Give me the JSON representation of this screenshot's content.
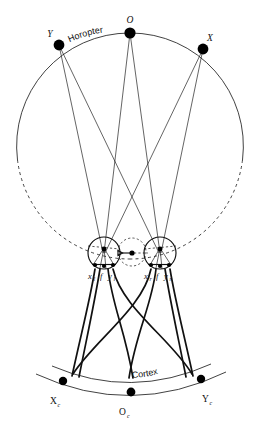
{
  "figure": {
    "background_color": "#ffffff",
    "line_color": "#111111"
  },
  "labels": {
    "horopter_curve": "Horopter",
    "cortex_curve": "Cortex",
    "point_left": "Y",
    "point_top": "O",
    "point_right": "X",
    "eye_left_temporal": "x",
    "eye_left_temporal_sub": "l",
    "eye_left_fovea": "f",
    "eye_left_nasal": "y",
    "eye_left_nasal_sub": "l",
    "eye_right_temporal": "x",
    "eye_right_temporal_sub": "r",
    "eye_right_fovea": "f",
    "eye_right_nasal": "y",
    "eye_right_nasal_sub": "r",
    "cortex_left": "X",
    "cortex_left_sub": "c",
    "cortex_center": "O",
    "cortex_center_sub": "c",
    "cortex_right": "Y",
    "cortex_right_sub": "c"
  },
  "geometry": {
    "horopter_circle": {
      "cx": 130,
      "cy": 146,
      "r": 113
    },
    "stimulus_points": [
      {
        "name": "Y",
        "x": 59,
        "y": 45,
        "r": 5.4
      },
      {
        "name": "O",
        "x": 130,
        "y": 33,
        "r": 5.6
      },
      {
        "name": "X",
        "x": 203,
        "y": 49,
        "r": 5.4
      }
    ],
    "eyes": [
      {
        "name": "left-eye",
        "cx": 104,
        "cy": 253,
        "r": 16
      },
      {
        "name": "right-eye",
        "cx": 160,
        "cy": 253,
        "r": 16
      }
    ],
    "cyclopean_eye": {
      "cx": 132,
      "cy": 252,
      "r": 14
    },
    "cortex_points": [
      {
        "name": "Xc",
        "x": 63,
        "y": 381,
        "r": 4.2
      },
      {
        "name": "Oc",
        "x": 131,
        "y": 392,
        "r": 4.4
      },
      {
        "name": "Yc",
        "x": 201,
        "y": 379,
        "r": 4.2
      }
    ]
  }
}
